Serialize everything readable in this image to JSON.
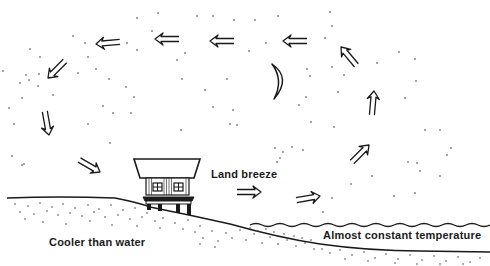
{
  "diagram": {
    "labels": {
      "land_breeze": "Land breeze",
      "land": "Cooler than water",
      "sea": "Almost constant temperature"
    },
    "elements": {
      "moon": "crescent-moon",
      "house": "house-on-stilts",
      "circulation_arrows": 11
    },
    "colors": {
      "ink": "#1a1a1a",
      "background": "#ffffff"
    }
  }
}
